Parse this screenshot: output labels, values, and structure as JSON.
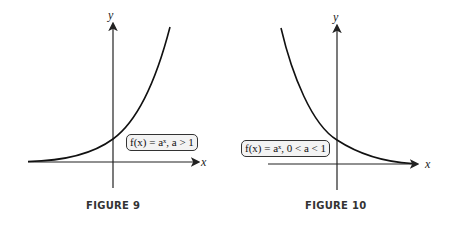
{
  "figures": [
    {
      "caption": "FIGURE 9",
      "function_label": "f(x) = aˣ, a > 1",
      "x_axis_label": "x",
      "y_axis_label": "y",
      "curve": "increasing exponential"
    },
    {
      "caption": "FIGURE 10",
      "function_label": "f(x) = aˣ, 0 < a < 1",
      "x_axis_label": "x",
      "y_axis_label": "y",
      "curve": "decreasing exponential"
    }
  ],
  "colors": {
    "axis": "#222222",
    "curve": "#111111",
    "label_bg": "#f3f3f3"
  }
}
